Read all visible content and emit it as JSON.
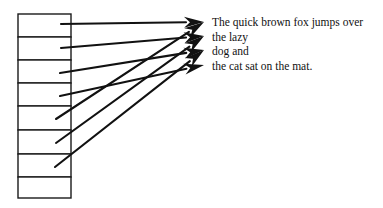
{
  "diagram": {
    "cell_count": 8,
    "text_lines": [
      "The quick brown fox jumps over",
      "the lazy",
      "dog and",
      "the cat sat on the mat."
    ],
    "pointers": [
      {
        "from_cell": 0,
        "to_line": 0
      },
      {
        "from_cell": 1,
        "to_line": 1
      },
      {
        "from_cell": 2,
        "to_line": 2
      },
      {
        "from_cell": 3,
        "to_line": 3
      },
      {
        "from_cell": 4,
        "to_line": 0
      },
      {
        "from_cell": 5,
        "to_line": 1
      },
      {
        "from_cell": 6,
        "to_line": 2
      }
    ],
    "colors": {
      "line": "#111111",
      "cell_border": "#1a1a1a",
      "background": "#ffffff"
    }
  }
}
